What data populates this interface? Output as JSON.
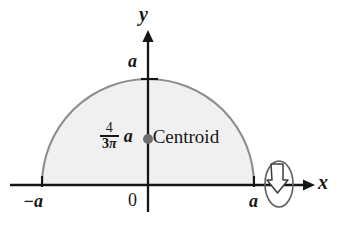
{
  "figure": {
    "type": "geometry-diagram",
    "axes": {
      "y_label": "y",
      "x_label": "x",
      "origin_label": "0"
    },
    "ticks": {
      "y_top": "a",
      "x_left": "−a",
      "x_right": "a"
    },
    "centroid": {
      "coefficient_numerator": "4",
      "coefficient_denominator_number": "3",
      "coefficient_denominator_symbol": "π",
      "variable": "a",
      "label": "Centroid"
    },
    "revolution_symbol": {
      "name": "rotation-about-x-axis",
      "axis": "x"
    },
    "colors": {
      "region_fill": "#f0f0f0",
      "region_stroke": "#8a8a8a",
      "axis": "#161616",
      "centroid_dot": "#6b6b6b",
      "text": "#161616"
    }
  }
}
